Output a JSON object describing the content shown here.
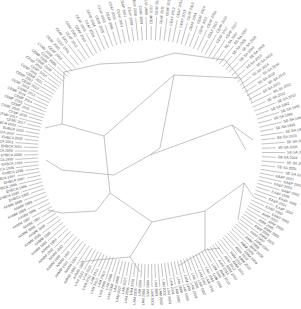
{
  "diagram": {
    "type": "circular-phylogenetic-tree",
    "center": [
      150,
      152
    ],
    "label_radius_outer": 143,
    "label_radius_inner": 128,
    "line_color": "#9a9a9a",
    "text_color": "#555555",
    "clades": [
      {
        "prefix": "SE-SA",
        "years": [
          "2007",
          "2008",
          "2009",
          "2013",
          "2014",
          "2010",
          "2011",
          "2012",
          "1992",
          "1996",
          "1999",
          "2003",
          "2000",
          "2004",
          "2001"
        ],
        "start_deg": -55,
        "end_deg": 10
      },
      {
        "prefix": "EA&P",
        "years": [
          "2001",
          "2002",
          "1999",
          "2004",
          "2003"
        ],
        "start_deg": 10,
        "end_deg": 28
      },
      {
        "prefix": "AMM",
        "years": [
          "2002",
          "2005",
          "2006",
          "2007",
          "2008",
          "2009",
          "2010",
          "2011",
          "2012",
          "2013"
        ],
        "start_deg": 28,
        "end_deg": 60
      },
      {
        "prefix": "LAM",
        "years": [
          "1995",
          "1996",
          "1997",
          "1998",
          "1999",
          "2000",
          "2001",
          "2002",
          "2003",
          "2004",
          "2005",
          "2006",
          "2007",
          "2008",
          "2009",
          "2010",
          "2011",
          "2012"
        ],
        "start_deg": 60,
        "end_deg": 120
      },
      {
        "prefix": "AAMM",
        "years": [
          "1990",
          "1991",
          "1992",
          "1993",
          "1994",
          "1995",
          "1996",
          "1997",
          "1998",
          "1999"
        ],
        "start_deg": 120,
        "end_deg": 160
      },
      {
        "prefix": "EHBCA",
        "years": [
          "1995",
          "1996",
          "1997",
          "1998",
          "1999",
          "2000",
          "2001",
          "2002",
          "2003"
        ],
        "start_deg": 160,
        "end_deg": 192
      },
      {
        "prefix": "CEMF",
        "years": [
          "2017",
          "2016",
          "2015",
          "2014",
          "2013",
          "2012",
          "2011",
          "2010",
          "2009",
          "2008"
        ],
        "start_deg": 192,
        "end_deg": 225
      },
      {
        "prefix": "CEAF",
        "years": [
          "2000",
          "2001",
          "2002",
          "2003",
          "2004",
          "2005",
          "2006",
          "2007",
          "2008",
          "2009",
          "2010",
          "2011",
          "2012",
          "2013",
          "2014",
          "2015",
          "2016",
          "2017"
        ],
        "start_deg": 225,
        "end_deg": 305
      }
    ],
    "inner_branches": [
      [
        [
          62,
          124
        ],
        [
          104,
          136
        ]
      ],
      [
        [
          104,
          136
        ],
        [
          110,
          193
        ]
      ],
      [
        [
          110,
          193
        ],
        [
          96,
          211
        ]
      ],
      [
        [
          96,
          211
        ],
        [
          62,
          213
        ]
      ],
      [
        [
          104,
          136
        ],
        [
          174,
          75
        ]
      ],
      [
        [
          174,
          75
        ],
        [
          240,
          78
        ]
      ],
      [
        [
          174,
          75
        ],
        [
          160,
          148
        ]
      ],
      [
        [
          160,
          148
        ],
        [
          150,
          155
        ]
      ],
      [
        [
          150,
          155
        ],
        [
          232,
          125
        ]
      ],
      [
        [
          150,
          155
        ],
        [
          114,
          175
        ]
      ],
      [
        [
          114,
          175
        ],
        [
          62,
          170
        ]
      ],
      [
        [
          110,
          193
        ],
        [
          152,
          222
        ]
      ],
      [
        [
          152,
          222
        ],
        [
          205,
          211
        ]
      ],
      [
        [
          205,
          211
        ],
        [
          244,
          183
        ]
      ],
      [
        [
          152,
          222
        ],
        [
          130,
          257
        ]
      ],
      [
        [
          130,
          257
        ],
        [
          96,
          260
        ]
      ],
      [
        [
          62,
          124
        ],
        [
          64,
          72
        ]
      ],
      [
        [
          64,
          72
        ],
        [
          100,
          64
        ]
      ],
      [
        [
          100,
          64
        ],
        [
          142,
          62
        ]
      ],
      [
        [
          142,
          62
        ],
        [
          175,
          53
        ]
      ],
      [
        [
          175,
          53
        ],
        [
          225,
          60
        ]
      ],
      [
        [
          225,
          60
        ],
        [
          240,
          78
        ]
      ],
      [
        [
          240,
          78
        ],
        [
          252,
          102
        ]
      ],
      [
        [
          232,
          125
        ],
        [
          253,
          140
        ]
      ],
      [
        [
          232,
          125
        ],
        [
          246,
          150
        ]
      ],
      [
        [
          244,
          183
        ],
        [
          253,
          196
        ]
      ],
      [
        [
          244,
          183
        ],
        [
          238,
          220
        ]
      ],
      [
        [
          205,
          211
        ],
        [
          205,
          250
        ]
      ],
      [
        [
          62,
          124
        ],
        [
          45,
          128
        ]
      ],
      [
        [
          62,
          170
        ],
        [
          46,
          160
        ]
      ],
      [
        [
          62,
          213
        ],
        [
          48,
          210
        ]
      ],
      [
        [
          96,
          260
        ],
        [
          80,
          262
        ]
      ],
      [
        [
          130,
          257
        ],
        [
          140,
          272
        ]
      ],
      [
        [
          205,
          250
        ],
        [
          220,
          248
        ]
      ],
      [
        [
          205,
          250
        ],
        [
          178,
          266
        ]
      ]
    ]
  }
}
